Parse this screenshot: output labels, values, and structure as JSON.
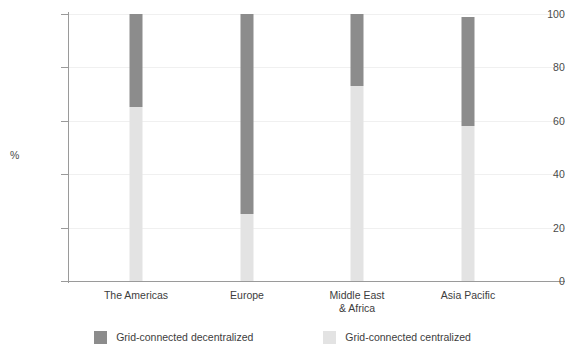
{
  "chart_data": {
    "type": "bar",
    "stacked": true,
    "title": "",
    "xlabel": "",
    "ylabel": "%",
    "ylim": [
      0,
      100
    ],
    "yticks": [
      0,
      20,
      40,
      60,
      80,
      100
    ],
    "grid": true,
    "legend_position": "bottom",
    "categories": [
      "The Americas",
      "Europe",
      "Middle East\n& Africa",
      "Asia Pacific"
    ],
    "series": [
      {
        "name": "Grid-connected centralized",
        "color": "#e3e3e3",
        "values": [
          65,
          25,
          73,
          58
        ]
      },
      {
        "name": "Grid-connected decentralized",
        "color": "#8c8c8c",
        "values": [
          35,
          75,
          27,
          41
        ]
      }
    ],
    "totals": [
      100,
      100,
      100,
      99
    ]
  },
  "axis": {
    "y_tick_labels": [
      "100",
      "80",
      "60",
      "40",
      "20",
      "0"
    ],
    "y_axis_title": "%"
  },
  "legend": {
    "items": [
      {
        "label": "Grid-connected decentralized",
        "color": "#8c8c8c"
      },
      {
        "label": "Grid-connected centralized",
        "color": "#e3e3e3"
      }
    ]
  },
  "colors": {
    "decentralized": "#8c8c8c",
    "centralized": "#e3e3e3",
    "axis": "#9a9a9a",
    "grid": "#f0f0f0",
    "text": "#3d3d3d",
    "background": "#ffffff"
  }
}
